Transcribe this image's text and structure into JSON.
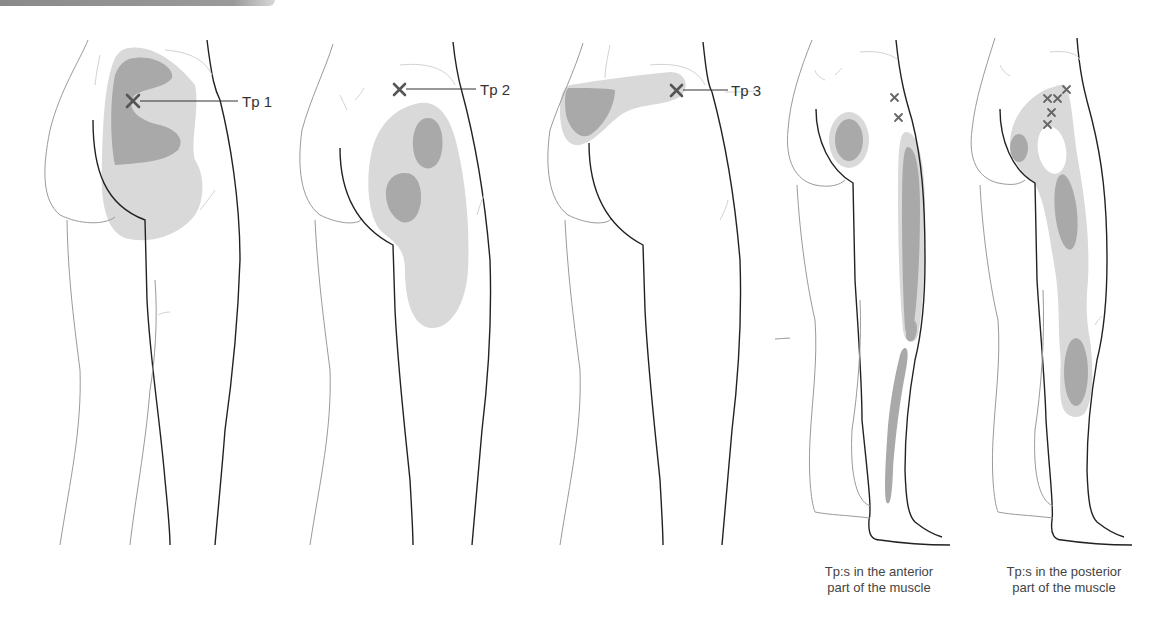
{
  "figure": {
    "panels": [
      {
        "id": "tp1",
        "label": "Tp 1"
      },
      {
        "id": "tp2",
        "label": "Tp 2"
      },
      {
        "id": "tp3",
        "label": "Tp 3"
      },
      {
        "id": "anterior",
        "caption_line1": "Tp:s in the anterior",
        "caption_line2": "part of the muscle"
      },
      {
        "id": "posterior",
        "caption_line1": "Tp:s in the posterior",
        "caption_line2": "part of the muscle"
      }
    ],
    "legend_colors": {
      "primary_pain_zone": "#a9a9a9",
      "spillover_pain_zone": "#d9d9d9",
      "trigger_point_marker": "#555555"
    }
  }
}
